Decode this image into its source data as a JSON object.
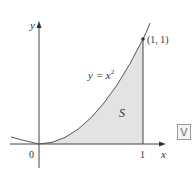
{
  "diagram": {
    "axes": {
      "x_label": "x",
      "y_label": "y",
      "origin_label": "0",
      "x_tick_label": "1"
    },
    "curve": {
      "label_prefix": "y = x",
      "label_exponent": "2"
    },
    "point": {
      "label": "(1, 1)"
    },
    "region": {
      "label": "S",
      "fill_color": "#e3e3e3"
    },
    "colors": {
      "line": "#444444",
      "region_fill": "#e3e3e3"
    },
    "badge": {
      "label": "V"
    }
  }
}
